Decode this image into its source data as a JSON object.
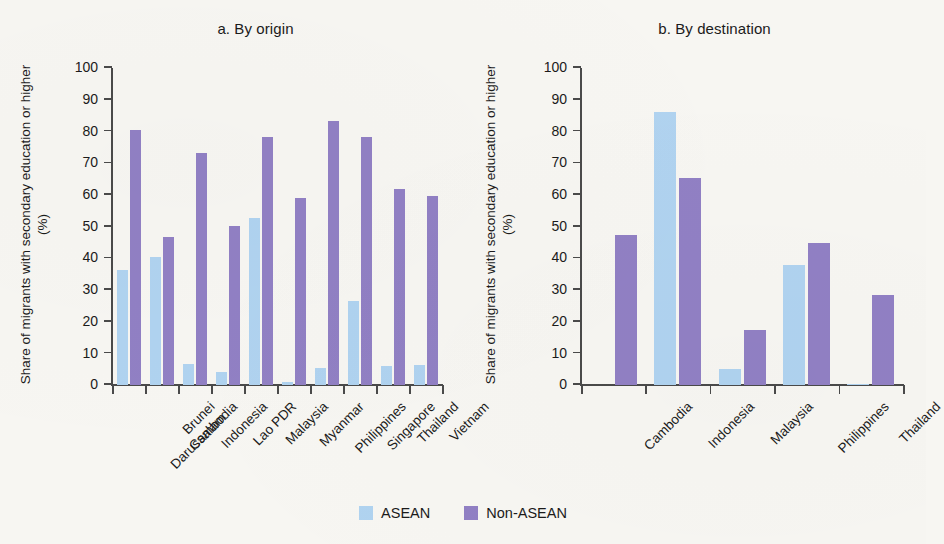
{
  "chart_data": [
    {
      "type": "bar",
      "title": "a. By origin",
      "panel_id": "a",
      "xlabel": "",
      "ylabel": "Share of migrants with secondary education or higher (%)",
      "ylim": [
        0,
        100
      ],
      "yticks": [
        0,
        10,
        20,
        30,
        40,
        50,
        60,
        70,
        80,
        90,
        100
      ],
      "grid": false,
      "legend_position": "bottom-center",
      "categories": [
        "Brunei\nDarussalam",
        "Cambodia",
        "Indonesia",
        "Lao PDR",
        "Malaysia",
        "Myanmar",
        "Philippines",
        "Singapore",
        "Thailand",
        "Vietnam"
      ],
      "series": [
        {
          "name": "ASEAN",
          "color": "#b0d3f0",
          "values": [
            36.3,
            40.5,
            6.6,
            4.0,
            52.8,
            1.0,
            5.4,
            26.4,
            6.0,
            6.4
          ]
        },
        {
          "name": "Non-ASEAN",
          "color": "#9180c4",
          "values": [
            80.4,
            46.8,
            73.2,
            50.3,
            78.2,
            59.0,
            83.4,
            78.2,
            61.9,
            59.5
          ]
        }
      ]
    },
    {
      "type": "bar",
      "title": "b. By destination",
      "panel_id": "b",
      "xlabel": "",
      "ylabel": "Share of migrants with secondary education or higher (%)",
      "ylim": [
        0,
        100
      ],
      "yticks": [
        0,
        10,
        20,
        30,
        40,
        50,
        60,
        70,
        80,
        90,
        100
      ],
      "grid": false,
      "legend_position": "bottom-center",
      "categories": [
        "Cambodia",
        "Indonesia",
        "Malaysia",
        "Philippines",
        "Thailand"
      ],
      "series": [
        {
          "name": "ASEAN",
          "color": "#b0d3f0",
          "values": [
            0.0,
            86.2,
            4.9,
            37.9,
            0.3
          ]
        },
        {
          "name": "Non-ASEAN",
          "color": "#9180c4",
          "values": [
            47.2,
            65.3,
            17.2,
            44.8,
            28.5
          ]
        }
      ]
    }
  ],
  "legend": {
    "items": [
      {
        "label": "ASEAN",
        "color": "#b0d3f0",
        "swatch": "asean-swatch"
      },
      {
        "label": "Non-ASEAN",
        "color": "#9180c4",
        "swatch": "non-asean-swatch"
      }
    ]
  },
  "colors": {
    "asean": "#b0d3f0",
    "non_asean": "#9180c4",
    "axis": "#4a4a4a",
    "text": "#1b1b1b",
    "background": "#f7f6f2"
  }
}
